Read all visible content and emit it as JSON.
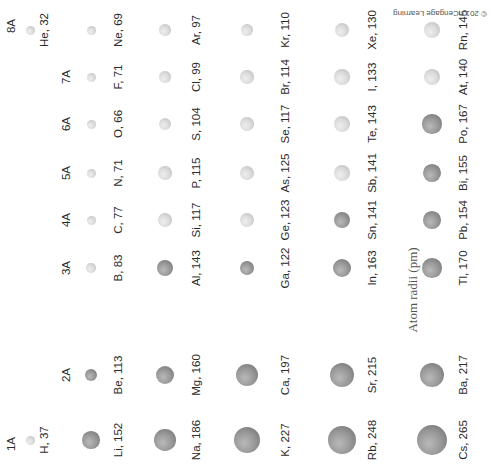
{
  "chart_data": {
    "type": "scatter",
    "title": "Atom radii (pm)",
    "orientation": "rotated 90° counter-clockwise; periods along x (left→right), groups along y (bottom→top)",
    "groups": [
      "1A",
      "2A",
      "3A",
      "4A",
      "5A",
      "6A",
      "7A",
      "8A"
    ],
    "periods": [
      1,
      2,
      3,
      4,
      5,
      6
    ],
    "legend": {
      "metal_color": "#8f8f8f",
      "nonmetal_color": "#d6d6d6"
    },
    "elements": [
      {
        "symbol": "H",
        "radius": 37,
        "period": 1,
        "group": "1A",
        "type": "nonmetal"
      },
      {
        "symbol": "He",
        "radius": 32,
        "period": 1,
        "group": "8A",
        "type": "nonmetal"
      },
      {
        "symbol": "Li",
        "radius": 152,
        "period": 2,
        "group": "1A",
        "type": "metal"
      },
      {
        "symbol": "Be",
        "radius": 113,
        "period": 2,
        "group": "2A",
        "type": "metal"
      },
      {
        "symbol": "B",
        "radius": 83,
        "period": 2,
        "group": "3A",
        "type": "nonmetal"
      },
      {
        "symbol": "C",
        "radius": 77,
        "period": 2,
        "group": "4A",
        "type": "nonmetal"
      },
      {
        "symbol": "N",
        "radius": 71,
        "period": 2,
        "group": "5A",
        "type": "nonmetal"
      },
      {
        "symbol": "O",
        "radius": 66,
        "period": 2,
        "group": "6A",
        "type": "nonmetal"
      },
      {
        "symbol": "F",
        "radius": 71,
        "period": 2,
        "group": "7A",
        "type": "nonmetal"
      },
      {
        "symbol": "Ne",
        "radius": 69,
        "period": 2,
        "group": "8A",
        "type": "nonmetal"
      },
      {
        "symbol": "Na",
        "radius": 186,
        "period": 3,
        "group": "1A",
        "type": "metal"
      },
      {
        "symbol": "Mg",
        "radius": 160,
        "period": 3,
        "group": "2A",
        "type": "metal"
      },
      {
        "symbol": "Al",
        "radius": 143,
        "period": 3,
        "group": "3A",
        "type": "metal"
      },
      {
        "symbol": "Si",
        "radius": 117,
        "period": 3,
        "group": "4A",
        "type": "nonmetal"
      },
      {
        "symbol": "P",
        "radius": 115,
        "period": 3,
        "group": "5A",
        "type": "nonmetal"
      },
      {
        "symbol": "S",
        "radius": 104,
        "period": 3,
        "group": "6A",
        "type": "nonmetal"
      },
      {
        "symbol": "Cl",
        "radius": 99,
        "period": 3,
        "group": "7A",
        "type": "nonmetal"
      },
      {
        "symbol": "Ar",
        "radius": 97,
        "period": 3,
        "group": "8A",
        "type": "nonmetal"
      },
      {
        "symbol": "K",
        "radius": 227,
        "period": 4,
        "group": "1A",
        "type": "metal"
      },
      {
        "symbol": "Ca",
        "radius": 197,
        "period": 4,
        "group": "2A",
        "type": "metal"
      },
      {
        "symbol": "Ga",
        "radius": 122,
        "period": 4,
        "group": "3A",
        "type": "metal"
      },
      {
        "symbol": "Ge",
        "radius": 123,
        "period": 4,
        "group": "4A",
        "type": "nonmetal"
      },
      {
        "symbol": "As",
        "radius": 125,
        "period": 4,
        "group": "5A",
        "type": "nonmetal"
      },
      {
        "symbol": "Se",
        "radius": 117,
        "period": 4,
        "group": "6A",
        "type": "nonmetal"
      },
      {
        "symbol": "Br",
        "radius": 114,
        "period": 4,
        "group": "7A",
        "type": "nonmetal"
      },
      {
        "symbol": "Kr",
        "radius": 110,
        "period": 4,
        "group": "8A",
        "type": "nonmetal"
      },
      {
        "symbol": "Rb",
        "radius": 248,
        "period": 5,
        "group": "1A",
        "type": "metal"
      },
      {
        "symbol": "Sr",
        "radius": 215,
        "period": 5,
        "group": "2A",
        "type": "metal"
      },
      {
        "symbol": "In",
        "radius": 163,
        "period": 5,
        "group": "3A",
        "type": "metal"
      },
      {
        "symbol": "Sn",
        "radius": 141,
        "period": 5,
        "group": "4A",
        "type": "metal"
      },
      {
        "symbol": "Sb",
        "radius": 141,
        "period": 5,
        "group": "5A",
        "type": "nonmetal"
      },
      {
        "symbol": "Te",
        "radius": 143,
        "period": 5,
        "group": "6A",
        "type": "nonmetal"
      },
      {
        "symbol": "I",
        "radius": 133,
        "period": 5,
        "group": "7A",
        "type": "nonmetal"
      },
      {
        "symbol": "Xe",
        "radius": 130,
        "period": 5,
        "group": "8A",
        "type": "nonmetal"
      },
      {
        "symbol": "Cs",
        "radius": 265,
        "period": 6,
        "group": "1A",
        "type": "metal"
      },
      {
        "symbol": "Ba",
        "radius": 217,
        "period": 6,
        "group": "2A",
        "type": "metal"
      },
      {
        "symbol": "Tl",
        "radius": 170,
        "period": 6,
        "group": "3A",
        "type": "metal"
      },
      {
        "symbol": "Pb",
        "radius": 154,
        "period": 6,
        "group": "4A",
        "type": "metal"
      },
      {
        "symbol": "Bi",
        "radius": 155,
        "period": 6,
        "group": "5A",
        "type": "metal"
      },
      {
        "symbol": "Po",
        "radius": 167,
        "period": 6,
        "group": "6A",
        "type": "metal"
      },
      {
        "symbol": "At",
        "radius": 140,
        "period": 6,
        "group": "7A",
        "type": "nonmetal"
      },
      {
        "symbol": "Rn",
        "radius": 145,
        "period": 6,
        "group": "8A",
        "type": "nonmetal"
      }
    ]
  },
  "labels": {
    "axis_title": "Atom radii (pm)",
    "copyright": "© 2013 Cengage Learning"
  }
}
